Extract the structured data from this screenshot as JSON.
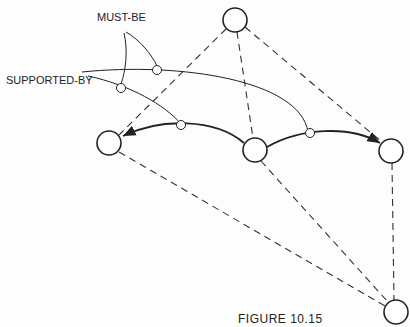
{
  "labels": {
    "must_be": "MUST-BE",
    "supported_by": "SUPPORTED-BY"
  },
  "caption": "FIGURE 10.15",
  "nodes": [
    "top",
    "left",
    "middle",
    "right",
    "bottom"
  ],
  "dashed_edges": [
    [
      "top",
      "left"
    ],
    [
      "top",
      "middle"
    ],
    [
      "top",
      "right"
    ],
    [
      "left",
      "bottom"
    ],
    [
      "middle",
      "bottom"
    ],
    [
      "right",
      "bottom"
    ]
  ],
  "arrows": [
    {
      "from": "middle",
      "to": "left"
    },
    {
      "from": "middle",
      "to": "right"
    }
  ]
}
